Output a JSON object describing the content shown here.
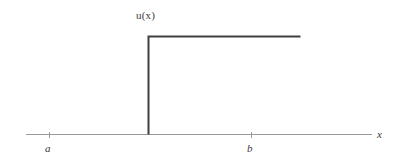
{
  "figure": {
    "background_color": "#ffffff",
    "width": 400,
    "height": 165
  },
  "labels": {
    "function": "u(x)",
    "axis_x": "x",
    "tick_a": "a",
    "tick_b": "b"
  },
  "colors": {
    "curve": "#3f3f3f",
    "axis": "#9a9a9a",
    "tick": "#9a9a9a",
    "text": "#3a3a3a"
  },
  "chart_data": {
    "type": "line",
    "title": "",
    "subtitle": "",
    "xlabel": "x",
    "ylabel": "u(x)",
    "grid": false,
    "legend": "none",
    "annotations": [
      {
        "text": "u(x)",
        "role": "curve-label",
        "x_px": 136,
        "y_px": 10
      },
      {
        "text": "a",
        "role": "x-tick-label",
        "x_px": 45,
        "y_px": 143
      },
      {
        "text": "b",
        "role": "x-tick-label",
        "x_px": 247,
        "y_px": 143
      },
      {
        "text": "x",
        "role": "axis-label",
        "x_px": 377,
        "y_px": 129
      }
    ],
    "axis": {
      "x_axis_y_px": 134,
      "x_axis_start_px": 26,
      "x_axis_end_px": 372,
      "ticks": [
        {
          "label": "a",
          "x_px": 49
        },
        {
          "label": "b",
          "x_px": 251
        }
      ],
      "tick_length_px": 6
    },
    "series": [
      {
        "name": "u(x)",
        "description": "Heaviside-type unit step function: zero to the left of the jump point, constant positive value to the right.",
        "points_px": [
          {
            "x": 148,
            "y": 134
          },
          {
            "x": 148,
            "y": 36
          },
          {
            "x": 300,
            "y": 36
          }
        ],
        "step_location_px": 148,
        "step_value_low": 0,
        "step_value_high": 1,
        "line_color": "#3f3f3f",
        "line_width_px": 2
      }
    ]
  }
}
